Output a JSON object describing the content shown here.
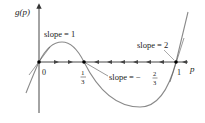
{
  "diagram": {
    "y_axis_label": "g(p)",
    "x_axis_label": "p",
    "points": [
      {
        "label": "0",
        "value": "0"
      },
      {
        "label_num": "1",
        "label_den": "3",
        "value": "1/3"
      },
      {
        "label": "1",
        "value": "1"
      }
    ],
    "slopes": {
      "at_0": "slope = 1",
      "at_1": "slope = 2",
      "at_third_prefix": "slope = −",
      "at_third_num": "2",
      "at_third_den": "3"
    },
    "flow_arrows": {
      "between_0_and_third": "right",
      "between_third_and_1": "left"
    },
    "colors": {
      "curve": "#8a8a8a",
      "tangent": "#555555",
      "axis": "#333333",
      "point": "#000000"
    }
  }
}
